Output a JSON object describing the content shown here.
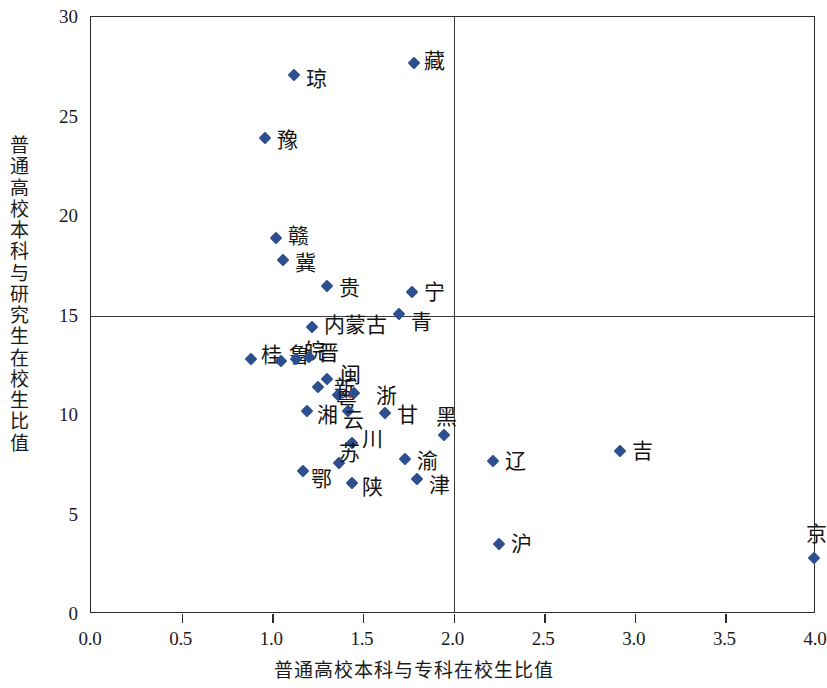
{
  "chart_data": {
    "type": "scatter",
    "title": "",
    "xlabel": "普通高校本科与专科在校生比值",
    "ylabel": "普通高校本科与研究生在校生比值",
    "xlim": [
      0.0,
      4.0
    ],
    "ylim": [
      0,
      30
    ],
    "xticks": [
      "0.0",
      "0.5",
      "1.0",
      "1.5",
      "2.0",
      "2.5",
      "3.0",
      "3.5",
      "4.0"
    ],
    "xtick_values": [
      0.0,
      0.5,
      1.0,
      1.5,
      2.0,
      2.5,
      3.0,
      3.5,
      4.0
    ],
    "yticks": [
      "0",
      "5",
      "10",
      "15",
      "20",
      "25",
      "30"
    ],
    "ytick_values": [
      0,
      5,
      10,
      15,
      20,
      25,
      30
    ],
    "grid": false,
    "legend": false,
    "marker": "diamond",
    "marker_color": "#2d4f8e",
    "reference_lines": {
      "vertical_x": 2.0,
      "horizontal_y": 15
    },
    "points": [
      {
        "label": "藏",
        "x": 1.78,
        "y": 27.7,
        "lx": 10,
        "ly": -2
      },
      {
        "label": "琼",
        "x": 1.12,
        "y": 27.1,
        "lx": 12,
        "ly": 4
      },
      {
        "label": "豫",
        "x": 0.96,
        "y": 23.9,
        "lx": 12,
        "ly": 2
      },
      {
        "label": "赣",
        "x": 1.02,
        "y": 18.9,
        "lx": 12,
        "ly": -2
      },
      {
        "label": "冀",
        "x": 1.06,
        "y": 17.8,
        "lx": 12,
        "ly": 3
      },
      {
        "label": "贵",
        "x": 1.3,
        "y": 16.5,
        "lx": 12,
        "ly": 2
      },
      {
        "label": "宁",
        "x": 1.77,
        "y": 16.2,
        "lx": 12,
        "ly": 0
      },
      {
        "label": "青",
        "x": 1.7,
        "y": 15.1,
        "lx": 12,
        "ly": 8
      },
      {
        "label": "内蒙古",
        "x": 1.22,
        "y": 14.4,
        "lx": 12,
        "ly": -2
      },
      {
        "label": "桂",
        "x": 0.88,
        "y": 12.8,
        "lx": 10,
        "ly": -4
      },
      {
        "label": "鲁",
        "x": 1.05,
        "y": 12.7,
        "lx": 8,
        "ly": -6
      },
      {
        "label": "皖",
        "x": 1.13,
        "y": 12.8,
        "lx": 8,
        "ly": -8
      },
      {
        "label": "晋",
        "x": 1.2,
        "y": 12.9,
        "lx": 9,
        "ly": -4
      },
      {
        "label": "闽",
        "x": 1.3,
        "y": 11.8,
        "lx": 13,
        "ly": -4
      },
      {
        "label": "新",
        "x": 1.25,
        "y": 11.4,
        "lx": 16,
        "ly": 1
      },
      {
        "label": "粤",
        "x": 1.36,
        "y": 11.0,
        "lx": -2,
        "ly": 5
      },
      {
        "label": "浙",
        "x": 1.45,
        "y": 11.1,
        "lx": 22,
        "ly": 3
      },
      {
        "label": "湘",
        "x": 1.19,
        "y": 10.2,
        "lx": 10,
        "ly": 4
      },
      {
        "label": "云",
        "x": 1.42,
        "y": 10.2,
        "lx": -5,
        "ly": 9
      },
      {
        "label": "甘",
        "x": 1.62,
        "y": 10.1,
        "lx": 12,
        "ly": 2
      },
      {
        "label": "黑",
        "x": 1.95,
        "y": 9.0,
        "lx": -8,
        "ly": -18
      },
      {
        "label": "川",
        "x": 1.44,
        "y": 8.6,
        "lx": 10,
        "ly": -4
      },
      {
        "label": "苏",
        "x": 1.37,
        "y": 7.6,
        "lx": 0,
        "ly": -10
      },
      {
        "label": "鄂",
        "x": 1.17,
        "y": 7.2,
        "lx": 8,
        "ly": 8
      },
      {
        "label": "陕",
        "x": 1.44,
        "y": 6.6,
        "lx": 10,
        "ly": 4
      },
      {
        "label": "渝",
        "x": 1.73,
        "y": 7.8,
        "lx": 12,
        "ly": 2
      },
      {
        "label": "津",
        "x": 1.8,
        "y": 6.8,
        "lx": 12,
        "ly": 6
      },
      {
        "label": "辽",
        "x": 2.22,
        "y": 7.7,
        "lx": 12,
        "ly": 0
      },
      {
        "label": "吉",
        "x": 2.92,
        "y": 8.2,
        "lx": 12,
        "ly": 0
      },
      {
        "label": "沪",
        "x": 2.25,
        "y": 3.5,
        "lx": 12,
        "ly": 0
      },
      {
        "label": "京",
        "x": 3.99,
        "y": 2.8,
        "lx": -8,
        "ly": -24
      }
    ]
  }
}
